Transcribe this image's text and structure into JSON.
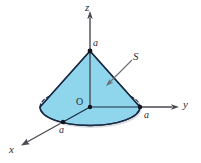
{
  "figure": {
    "kind": "3d-cone-diagram",
    "background_color": "#ffffff",
    "cone": {
      "fill_color": "#8fd6ec",
      "fill_color_shadow": "#7cc7e0",
      "edge_color": "#1b2a44",
      "base_shadow_color": "#b9c4c9"
    },
    "axes": {
      "line_color": "#4a4a52",
      "z": {
        "label": "z"
      },
      "y": {
        "label": "y"
      },
      "x": {
        "label": "x"
      }
    },
    "origin": {
      "label": "O"
    },
    "dimension_labels": {
      "height": "a",
      "radius_y": "a",
      "radius_x": "a"
    },
    "surface": {
      "label": "S",
      "leader_color": "#6c6c74"
    }
  }
}
